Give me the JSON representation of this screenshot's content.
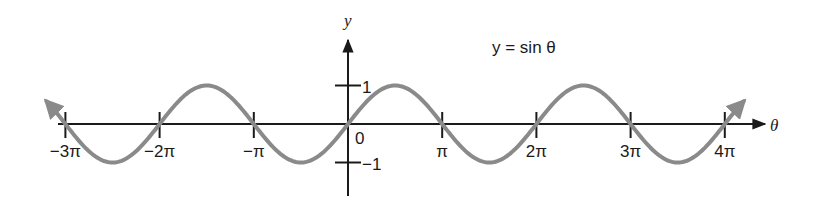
{
  "chart_data": {
    "type": "line",
    "title": "y = sin θ",
    "xlabel": "θ",
    "ylabel": "y",
    "function": "sin",
    "x_range": [
      -3.2,
      4.2
    ],
    "x_range_units": "π",
    "ylim": [
      -1,
      1
    ],
    "grid": false,
    "legend": null,
    "x_ticks": [
      {
        "value": -3,
        "label": "−3π"
      },
      {
        "value": -2,
        "label": "−2π"
      },
      {
        "value": -1,
        "label": "−π"
      },
      {
        "value": 1,
        "label": "π"
      },
      {
        "value": 2,
        "label": "2π"
      },
      {
        "value": 3,
        "label": "3π"
      },
      {
        "value": 4,
        "label": "4π"
      }
    ],
    "y_ticks": [
      {
        "value": 1,
        "label": "1"
      },
      {
        "value": -1,
        "label": "−1"
      }
    ],
    "origin_label": "0",
    "series": [
      {
        "name": "y = sin θ",
        "color": "#8a8a8a",
        "x_pi": [
          -3,
          -2.5,
          -2,
          -1.5,
          -1,
          -0.5,
          0,
          0.5,
          1,
          1.5,
          2,
          2.5,
          3,
          3.5,
          4
        ],
        "y": [
          0,
          -1,
          0,
          1,
          0,
          -1,
          0,
          1,
          0,
          -1,
          0,
          1,
          0,
          -1,
          0
        ]
      }
    ]
  },
  "colors": {
    "axis": "#1a1a1a",
    "curve": "#8a8a8a",
    "background": "#ffffff"
  }
}
